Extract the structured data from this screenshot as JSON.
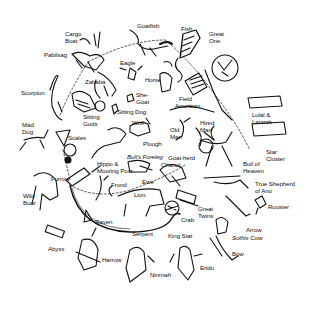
{
  "diagram": {
    "colors": {
      "ink": "#111111",
      "background": "#ffffff"
    },
    "labels": [
      {
        "id": "goatfish",
        "text": "Goatfish",
        "x": 137,
        "y": 22
      },
      {
        "id": "fish",
        "text": "Fish",
        "x": 181,
        "y": 25
      },
      {
        "id": "great-one",
        "text": "Great\nOne",
        "x": 209,
        "y": 30
      },
      {
        "id": "cargo-boat",
        "text": "Cargo\nBoat",
        "x": 65,
        "y": 30
      },
      {
        "id": "pabilsag",
        "text": "Pabilsag",
        "x": 44,
        "y": 51
      },
      {
        "id": "eagle",
        "text": "Eagle",
        "x": 120,
        "y": 59
      },
      {
        "id": "horse",
        "text": "Horse",
        "x": 145,
        "y": 76
      },
      {
        "id": "zababa",
        "text": "Zababa",
        "x": 85,
        "y": 78
      },
      {
        "id": "scorpion",
        "text": "Scorpion",
        "x": 21,
        "y": 89
      },
      {
        "id": "she-goat",
        "text": "She-\nGoat",
        "x": 136,
        "y": 91
      },
      {
        "id": "field",
        "text": "Field",
        "x": 179,
        "y": 95
      },
      {
        "id": "anunitum",
        "text": "Anunitum",
        "x": 175,
        "y": 102
      },
      {
        "id": "lulal-latarak",
        "text": "Lulal &\nLatarak",
        "x": 252,
        "y": 111
      },
      {
        "id": "sitting-dog",
        "text": "Sitting Dog",
        "x": 117,
        "y": 108
      },
      {
        "id": "sitting-gods",
        "text": "Sitting\nGods",
        "x": 83,
        "y": 113
      },
      {
        "id": "wolf",
        "text": "Wolf",
        "x": 132,
        "y": 119
      },
      {
        "id": "hired-man",
        "text": "Hired\nMan",
        "x": 200,
        "y": 119
      },
      {
        "id": "old-man",
        "text": "Old\nMan",
        "x": 170,
        "y": 126
      },
      {
        "id": "mad-dog",
        "text": "Mad\nDog",
        "x": 22,
        "y": 121
      },
      {
        "id": "scales",
        "text": "Scales",
        "x": 68,
        "y": 134
      },
      {
        "id": "star-cluster",
        "text": "Star\nCluster",
        "x": 266,
        "y": 148
      },
      {
        "id": "plough",
        "text": "Plough",
        "x": 143,
        "y": 140
      },
      {
        "id": "bulls-foreleg",
        "text": "Bull's Foreleg",
        "x": 127,
        "y": 153,
        "italic": true
      },
      {
        "id": "goat-herd",
        "text": "Goat-herd",
        "x": 168,
        "y": 154
      },
      {
        "id": "chariot",
        "text": "Chariot",
        "x": 161,
        "y": 161
      },
      {
        "id": "bull-of-heaven",
        "text": "Bull of\nHeaven",
        "x": 243,
        "y": 160
      },
      {
        "id": "hippo-mooring-post",
        "text": "Hippo &\nMooring Post",
        "x": 97,
        "y": 160
      },
      {
        "id": "furrow",
        "text": "Furrow",
        "x": 51,
        "y": 175
      },
      {
        "id": "frond",
        "text": "Frond",
        "x": 111,
        "y": 181
      },
      {
        "id": "ewe",
        "text": "Ewe",
        "x": 142,
        "y": 178
      },
      {
        "id": "true-shepherd",
        "text": "True Shepherd\nof Anu",
        "x": 255,
        "y": 180
      },
      {
        "id": "wild-boar",
        "text": "Wild\nBoar",
        "x": 23,
        "y": 192
      },
      {
        "id": "lion",
        "text": "Lion",
        "x": 134,
        "y": 191
      },
      {
        "id": "great-twins",
        "text": "Great\nTwins",
        "x": 198,
        "y": 205
      },
      {
        "id": "rooster",
        "text": "Rooster",
        "x": 268,
        "y": 203
      },
      {
        "id": "raven",
        "text": "Raven",
        "x": 95,
        "y": 218
      },
      {
        "id": "crab",
        "text": "Crab",
        "x": 181,
        "y": 216
      },
      {
        "id": "serpent",
        "text": "Serpent",
        "x": 132,
        "y": 230
      },
      {
        "id": "king-star",
        "text": "King Star",
        "x": 168,
        "y": 232
      },
      {
        "id": "arrow",
        "text": "Arrow",
        "x": 246,
        "y": 226
      },
      {
        "id": "sothis-cow",
        "text": "Sothis Cow",
        "x": 232,
        "y": 234,
        "italic": true
      },
      {
        "id": "abyss",
        "text": "Abyss",
        "x": 48,
        "y": 245
      },
      {
        "id": "harrow",
        "text": "Harrow",
        "x": 102,
        "y": 256
      },
      {
        "id": "bow",
        "text": "Bow",
        "x": 232,
        "y": 250
      },
      {
        "id": "ninmah",
        "text": "Ninmah",
        "x": 150,
        "y": 271
      },
      {
        "id": "eridu",
        "text": "Eridu",
        "x": 200,
        "y": 264
      }
    ]
  }
}
